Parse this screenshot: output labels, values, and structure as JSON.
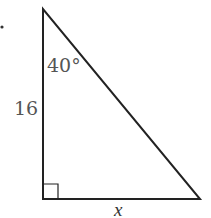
{
  "diagram": {
    "type": "right-triangle",
    "angle_label": "40°",
    "side_label": "16",
    "base_label": "x",
    "vertices": {
      "top": [
        43,
        9
      ],
      "bottom_left": [
        43,
        199
      ],
      "bottom_right": [
        200,
        199
      ]
    },
    "right_angle_marker_size": 15,
    "stroke_color": "#222222",
    "label_color": "#555555"
  }
}
